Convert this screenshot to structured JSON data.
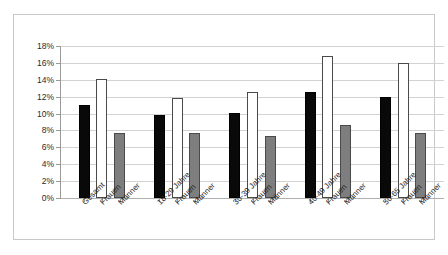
{
  "chart_data": {
    "type": "bar",
    "title": "",
    "subtitle": "",
    "xlabel": "",
    "ylabel": "",
    "ylim": [
      0,
      18
    ],
    "ytick_labels": [
      "18%",
      "16%",
      "14%",
      "12%",
      "10%",
      "8%",
      "6%",
      "4%",
      "2%",
      "0%"
    ],
    "ytick_values": [
      18,
      16,
      14,
      12,
      10,
      8,
      6,
      4,
      2,
      0
    ],
    "grid": true,
    "legend": "none",
    "value_unit": "%",
    "categories": [
      "Gesamt",
      "Frauen",
      "Männer",
      "18-29 Jahre",
      "Frauen",
      "Männer",
      "30-39 Jahre",
      "Frauen",
      "Männer",
      "40-49 Jahre",
      "Frauen",
      "Männer",
      "50-65 Jahre",
      "Frauen",
      "Männer"
    ],
    "values": [
      11.0,
      14.1,
      7.7,
      9.8,
      11.8,
      7.7,
      10.1,
      12.6,
      7.4,
      12.6,
      16.8,
      8.6,
      12.0,
      16.0,
      7.7
    ],
    "bar_styles": [
      "black",
      "white",
      "gray",
      "black",
      "white",
      "gray",
      "black",
      "white",
      "gray",
      "black",
      "white",
      "gray",
      "black",
      "white",
      "gray"
    ],
    "groups": [
      {
        "name": "Gesamt",
        "bars": [
          {
            "label": "Gesamt",
            "value": 11.0,
            "style": "black"
          },
          {
            "label": "Frauen",
            "value": 14.1,
            "style": "white"
          },
          {
            "label": "Männer",
            "value": 7.7,
            "style": "gray"
          }
        ]
      },
      {
        "name": "18-29 Jahre",
        "bars": [
          {
            "label": "18-29 Jahre",
            "value": 9.8,
            "style": "black"
          },
          {
            "label": "Frauen",
            "value": 11.8,
            "style": "white"
          },
          {
            "label": "Männer",
            "value": 7.7,
            "style": "gray"
          }
        ]
      },
      {
        "name": "30-39 Jahre",
        "bars": [
          {
            "label": "30-39 Jahre",
            "value": 10.1,
            "style": "black"
          },
          {
            "label": "Frauen",
            "value": 12.6,
            "style": "white"
          },
          {
            "label": "Männer",
            "value": 7.4,
            "style": "gray"
          }
        ]
      },
      {
        "name": "40-49 Jahre",
        "bars": [
          {
            "label": "40-49 Jahre",
            "value": 12.6,
            "style": "black"
          },
          {
            "label": "Frauen",
            "value": 16.8,
            "style": "white"
          },
          {
            "label": "Männer",
            "value": 8.6,
            "style": "gray"
          }
        ]
      },
      {
        "name": "50-65 Jahre",
        "bars": [
          {
            "label": "50-65 Jahre",
            "value": 12.0,
            "style": "black"
          },
          {
            "label": "Frauen",
            "value": 16.0,
            "style": "white"
          },
          {
            "label": "Männer",
            "value": 7.7,
            "style": "gray"
          }
        ]
      }
    ],
    "colors": {
      "black_bar": "#090909",
      "white_bar": "#ffffff",
      "gray_bar": "#7e7e7e",
      "bar_border": "#4a4a4a",
      "gridline": "#d2d2d2",
      "axis": "#9a9a9a",
      "frame": "#c9c9c9",
      "background": "#ffffff",
      "text": "#1f1f1f"
    }
  }
}
